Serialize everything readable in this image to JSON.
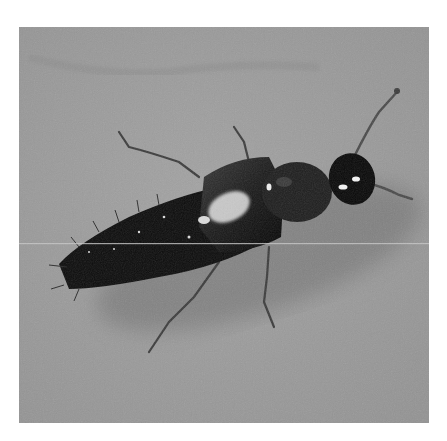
{
  "image": {
    "subject": "rove beetle",
    "description": "Grayscale photograph of a glossy black rove beetle on a textured gray surface, head toward upper right, abdomen tapering toward lower left",
    "colors": {
      "background": "#9a9a9a",
      "background_dark": "#7e7e7e",
      "shadow": "#6e6e6e",
      "body": "#0e0e0e",
      "highlight": "#f2f2f2",
      "legs": "#3c3c3c",
      "page": "#ffffff"
    }
  }
}
